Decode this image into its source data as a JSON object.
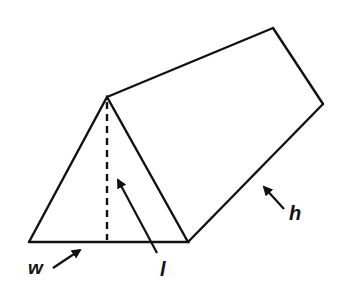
{
  "diagram": {
    "stroke_color": "#111111",
    "background": "#ffffff",
    "labels": {
      "width": "w",
      "length": "l",
      "height": "h"
    }
  }
}
